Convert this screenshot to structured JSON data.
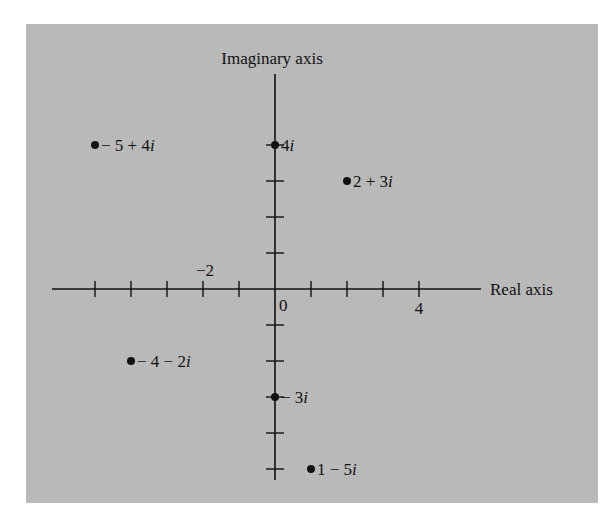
{
  "chart_data": {
    "type": "scatter",
    "title": "",
    "xlabel": "Real axis",
    "ylabel": "Imaginary axis",
    "xlim": [
      -5,
      5
    ],
    "ylim": [
      -5,
      4
    ],
    "grid": false,
    "x_ticks": [
      -5,
      -4,
      -3,
      -2,
      -1,
      0,
      1,
      2,
      3,
      4
    ],
    "y_ticks": [
      -5,
      -4,
      -3,
      -2,
      -1,
      0,
      1,
      2,
      3,
      4
    ],
    "x_tick_labels": [
      {
        "value": -2,
        "text": "−2"
      },
      {
        "value": 0,
        "text": "0"
      },
      {
        "value": 4,
        "text": "4"
      }
    ],
    "points": [
      {
        "x": -5,
        "y": 4,
        "label": "− 5 + 4i",
        "parts": [
          "− 5 + 4",
          "i"
        ]
      },
      {
        "x": 0,
        "y": 4,
        "label": "4i",
        "parts": [
          "4",
          "i"
        ]
      },
      {
        "x": 2,
        "y": 3,
        "label": "2 + 3i",
        "parts": [
          "2 + 3",
          "i"
        ]
      },
      {
        "x": -4,
        "y": -2,
        "label": "− 4 − 2i",
        "parts": [
          "− 4 − 2",
          "i"
        ]
      },
      {
        "x": 0,
        "y": -3,
        "label": "− 3i",
        "parts": [
          "− 3",
          "i"
        ]
      },
      {
        "x": 1,
        "y": -5,
        "label": "1 − 5i",
        "parts": [
          "1 − 5",
          "i"
        ]
      }
    ],
    "colors": {
      "background": "#b9b9b9",
      "ink": "#111111"
    }
  }
}
